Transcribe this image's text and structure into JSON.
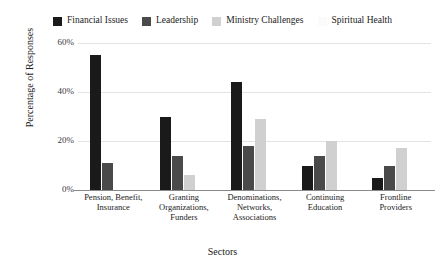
{
  "chart_data": {
    "type": "bar",
    "title": "",
    "xlabel": "Sectors",
    "ylabel": "Percentage of Responses",
    "ylim": [
      0,
      60
    ],
    "ytick_labels": [
      "0%",
      "20%",
      "40%",
      "60%"
    ],
    "ytick_values": [
      0,
      20,
      40,
      60
    ],
    "grid": true,
    "legend_position": "top",
    "categories": [
      "Pension, Benefit, Insurance",
      "Granting Organizations, Funders",
      "Denominations, Networks, Associations",
      "Continuing Education",
      "Frontline Providers"
    ],
    "category_lines": [
      [
        "Pension, Benefit,",
        "Insurance"
      ],
      [
        "Granting",
        "Organizations,",
        "Funders"
      ],
      [
        "Denominations,",
        "Networks,",
        "Associations"
      ],
      [
        "Continuing",
        "Education"
      ],
      [
        "Frontline",
        "Providers"
      ]
    ],
    "series": [
      {
        "name": "Financial Issues",
        "color": "#1a1a1a",
        "values": [
          55,
          30,
          44,
          10,
          5
        ]
      },
      {
        "name": "Leadership",
        "color": "#4a4a4a",
        "values": [
          11,
          14,
          18,
          14,
          10
        ]
      },
      {
        "name": "Ministry Challenges",
        "color": "#d0d0d0",
        "values": [
          0,
          6,
          29,
          20,
          17
        ]
      },
      {
        "name": "Spiritual Health",
        "color": "#fbfbfb",
        "values": [
          0,
          0,
          0,
          0,
          0
        ]
      }
    ]
  },
  "legend": {
    "items": [
      {
        "label": "Financial Issues",
        "color": "#1a1a1a"
      },
      {
        "label": "Leadership",
        "color": "#4a4a4a"
      },
      {
        "label": "Ministry Challenges",
        "color": "#d0d0d0"
      },
      {
        "label": "Spiritual Health",
        "color": "#fbfbfb"
      }
    ]
  },
  "axes": {
    "x_title": "Sectors",
    "y_title": "Percentage of Responses"
  }
}
